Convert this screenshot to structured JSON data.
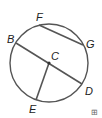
{
  "diagram": {
    "type": "circle-geometry",
    "center": {
      "label": "C",
      "x": 49,
      "y": 63
    },
    "radius": 39,
    "points": [
      {
        "label": "F",
        "x": 39,
        "y": 25,
        "lx": 36,
        "ly": 21
      },
      {
        "label": "G",
        "x": 83,
        "y": 45,
        "lx": 86,
        "ly": 48
      },
      {
        "label": "B",
        "x": 16,
        "y": 43,
        "lx": 7,
        "ly": 43
      },
      {
        "label": "D",
        "x": 82,
        "y": 84,
        "lx": 85,
        "ly": 95
      },
      {
        "label": "E",
        "x": 36,
        "y": 100,
        "lx": 29,
        "ly": 113
      }
    ],
    "segments": [
      {
        "name": "chord-FG",
        "from": "F",
        "to": "G"
      },
      {
        "name": "diameter-BD",
        "from": "B",
        "to": "D"
      },
      {
        "name": "radius-CE",
        "from": "C",
        "to": "E"
      }
    ],
    "colors": {
      "stroke": "#555555",
      "label": "#222222"
    }
  },
  "corner_mark": "⊞"
}
